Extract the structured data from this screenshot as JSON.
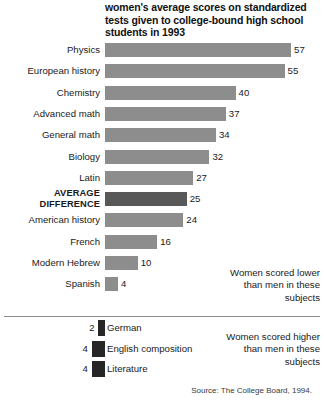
{
  "chart_data": {
    "type": "bar",
    "title": "women's average scores on standardized tests given to college-bound high school students in 1993",
    "xlabel": "",
    "ylabel": "",
    "orientation": "horizontal",
    "grid": false,
    "xlim": [
      -10,
      60
    ],
    "legend": "none",
    "categories": [
      "Physics",
      "European history",
      "Chemistry",
      "Advanced math",
      "General math",
      "Biology",
      "Latin",
      "AVERAGE DIFFERENCE",
      "American history",
      "French",
      "Modern Hebrew",
      "Spanish",
      "German",
      "English composition",
      "Literature"
    ],
    "values": [
      57,
      55,
      40,
      37,
      34,
      32,
      27,
      25,
      24,
      16,
      10,
      4,
      -2,
      -4,
      -4
    ],
    "annotations": [
      "Women scored lower than men in these subjects",
      "Women scored higher than men in these subjects"
    ],
    "source": "Source: The College Board, 1994."
  },
  "title": {
    "line1": "women's average scores on standardized",
    "line2": "tests given to college-bound high school",
    "line3": "students in 1993"
  },
  "rows": [
    {
      "label": "Physics",
      "value": "57",
      "magnitude": 57,
      "style": "normal"
    },
    {
      "label": "European history",
      "value": "55",
      "magnitude": 55,
      "style": "normal"
    },
    {
      "label": "Chemistry",
      "value": "40",
      "magnitude": 40,
      "style": "normal"
    },
    {
      "label": "Advanced math",
      "value": "37",
      "magnitude": 37,
      "style": "normal"
    },
    {
      "label": "General math",
      "value": "34",
      "magnitude": 34,
      "style": "normal"
    },
    {
      "label": "Biology",
      "value": "32",
      "magnitude": 32,
      "style": "normal"
    },
    {
      "label": "Latin",
      "value": "27",
      "magnitude": 27,
      "style": "normal"
    },
    {
      "label": "AVERAGE DIFFERENCE",
      "value": "25",
      "magnitude": 25,
      "style": "average"
    },
    {
      "label": "American history",
      "value": "24",
      "magnitude": 24,
      "style": "normal"
    },
    {
      "label": "French",
      "value": "16",
      "magnitude": 16,
      "style": "normal"
    },
    {
      "label": "Modern Hebrew",
      "value": "10",
      "magnitude": 10,
      "style": "normal"
    },
    {
      "label": "Spanish",
      "value": "4",
      "magnitude": 4,
      "style": "normal"
    }
  ],
  "negative_rows": [
    {
      "label": "German",
      "value": "2",
      "magnitude": 2
    },
    {
      "label": "English composition",
      "value": "4",
      "magnitude": 4
    },
    {
      "label": "Literature",
      "value": "4",
      "magnitude": 4
    }
  ],
  "notes": {
    "lower": "Women scored lower than men in these subjects",
    "higher": "Women scored higher than men in these subjects"
  },
  "source": "Source: The College Board, 1994.",
  "colors": {
    "bar": "#8d8d8d",
    "bar_average": "#585858",
    "bar_negative": "#262626",
    "divider": "#8c8c8c",
    "text": "#1a1a1a",
    "background": "#ffffff"
  }
}
